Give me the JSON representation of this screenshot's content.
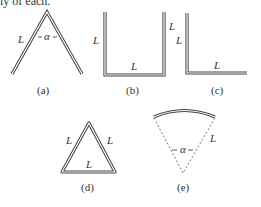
{
  "top_text": "ly of each.",
  "figures": [
    {
      "id": "a",
      "caption": "(a)",
      "labels": [
        "L",
        "α"
      ],
      "shape": "bent-wire-angle"
    },
    {
      "id": "b",
      "caption": "(b)",
      "labels": [
        "L",
        "L",
        "L"
      ],
      "shape": "u-shape"
    },
    {
      "id": "c",
      "caption": "(c)",
      "labels": [
        "L",
        "L"
      ],
      "shape": "l-shape"
    },
    {
      "id": "d",
      "caption": "(d)",
      "labels": [
        "L",
        "L",
        "L"
      ],
      "shape": "triangle"
    },
    {
      "id": "e",
      "caption": "(e)",
      "labels": [
        "α",
        "L"
      ],
      "shape": "circular-arc"
    }
  ],
  "symbols": {
    "length": "L",
    "angle": "α"
  }
}
